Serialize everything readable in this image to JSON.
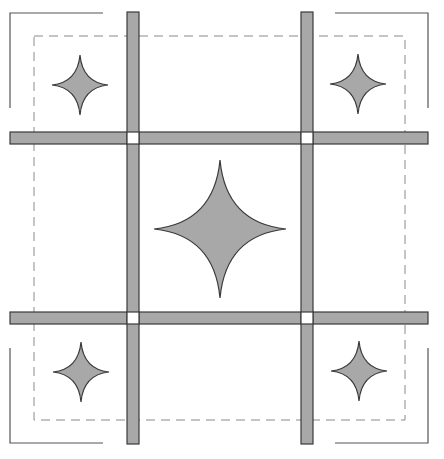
{
  "diagram": {
    "colors": {
      "background": "#ffffff",
      "fill": "#a8a8a8",
      "stroke": "#3a3a3a",
      "dashed": "#8a8a8a",
      "bracket": "#555555",
      "cornerstone": "#ffffff"
    },
    "dashed_border": {
      "x1": 34,
      "y1": 36,
      "x2": 405,
      "y2": 420,
      "dash": "9,6"
    },
    "corner_brackets": [
      {
        "name": "top-left",
        "points": "10,108 10,13 103,13"
      },
      {
        "name": "top-right",
        "points": "335,13 428,13 428,108"
      },
      {
        "name": "bottom-left",
        "points": "10,348 10,443 103,443"
      },
      {
        "name": "bottom-right",
        "points": "335,443 428,443 428,348"
      }
    ],
    "vertical_bars": [
      {
        "name": "left",
        "x": 127,
        "y": 12,
        "w": 12,
        "h": 432
      },
      {
        "name": "right",
        "x": 301,
        "y": 12,
        "w": 12,
        "h": 432
      }
    ],
    "horizontal_bars": [
      {
        "name": "top",
        "x": 10,
        "y": 132,
        "w": 418,
        "h": 12
      },
      {
        "name": "bottom",
        "x": 10,
        "y": 312,
        "w": 418,
        "h": 12
      }
    ],
    "cornerstones": [
      {
        "x": 127,
        "y": 132,
        "w": 12,
        "h": 12
      },
      {
        "x": 301,
        "y": 132,
        "w": 12,
        "h": 12
      },
      {
        "x": 127,
        "y": 312,
        "w": 12,
        "h": 12
      },
      {
        "x": 301,
        "y": 312,
        "w": 12,
        "h": 12
      }
    ],
    "stars": [
      {
        "name": "top-left",
        "cx": 80,
        "cy": 85,
        "rx": 28,
        "ry": 30
      },
      {
        "name": "top-right",
        "cx": 358,
        "cy": 84,
        "rx": 28,
        "ry": 30
      },
      {
        "name": "center",
        "cx": 220,
        "cy": 229,
        "rx": 66,
        "ry": 69
      },
      {
        "name": "bottom-left",
        "cx": 81,
        "cy": 372,
        "rx": 28,
        "ry": 30
      },
      {
        "name": "bottom-right",
        "cx": 359,
        "cy": 371,
        "rx": 28,
        "ry": 30
      }
    ]
  }
}
